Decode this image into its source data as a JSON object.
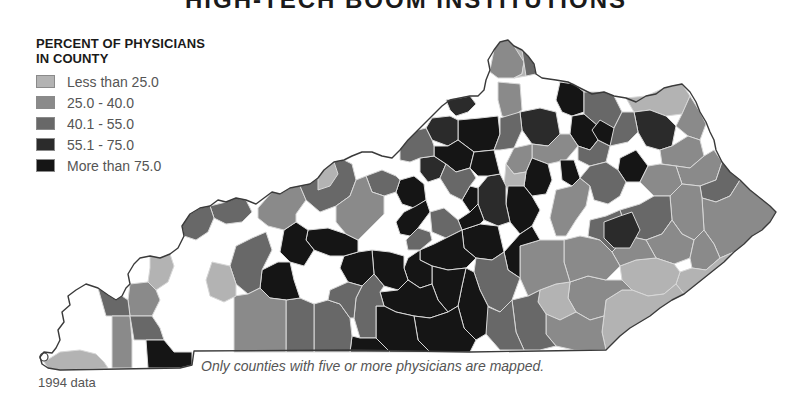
{
  "title": "HIGH-TECH BOOM INSTITUTIONS",
  "legend": {
    "title_line1": "PERCENT OF PHYSICIANS",
    "title_line2": "IN COUNTY",
    "items": [
      {
        "label": "Less than 25.0",
        "color": "#b3b3b3"
      },
      {
        "label": "25.0 - 40.0",
        "color": "#8a8a8a"
      },
      {
        "label": "40.1 - 55.0",
        "color": "#686868"
      },
      {
        "label": "55.1 - 75.0",
        "color": "#2b2b2b"
      },
      {
        "label": "More than 75.0",
        "color": "#151515"
      }
    ]
  },
  "note": "Only counties with five or more physicians are mapped.",
  "source": "1994 data",
  "colors": {
    "unmapped": "#ffffff",
    "border": "#d8d8d8",
    "outline": "#3a3a3a"
  },
  "map": {
    "state": "Kentucky",
    "outline": "M40,357 L44,352 L52,353 L56,348 L60,340 L58,330 L64,322 L62,312 L70,305 L68,296 L76,290 L86,284 L98,288 L108,295 L116,300 L122,296 L126,288 L130,284 L128,274 L134,264 L140,258 L150,256 L160,258 L170,254 L178,248 L184,236 L182,226 L190,214 L200,208 L210,206 L218,200 L226,202 L236,198 L246,200 L256,204 L264,198 L272,192 L280,194 L290,188 L300,186 L310,184 L318,178 L324,170 L334,162 L344,160 L352,156 L362,152 L372,152 L382,156 L392,158 L400,150 L408,140 L418,130 L426,122 L434,114 L442,106 L450,100 L460,98 L470,96 L478,96 L484,90 L486,80 L490,70 L488,60 L494,50 L500,42 L508,40 L514,46 L522,50 L528,56 L534,64 L536,74 L542,78 L556,80 L568,82 L580,88 L592,94 L604,92 L614,96 L626,98 L636,102 L646,96 L656,94 L664,88 L672,86 L682,84 L690,92 L696,102 L700,112 L706,122 L710,132 L714,140 L716,150 L722,162 L730,172 L740,180 L750,190 L760,198 L770,206 L776,212 L770,222 L762,230 L752,236 L744,244 L734,252 L724,262 L714,270 L704,278 L694,286 L684,294 L672,300 L660,308 L650,316 L640,322 L630,328 L620,336 L612,344 L606,350 L470,352 L350,350 L194,351 L192,365 L180,368 L60,370 L48,368 L42,364 Z",
    "counties": [
      {
        "id": "c1",
        "cls": 1,
        "d": "M490,70 L494,50 L500,42 L508,40 L514,46 L520,50 L524,62 L522,74 L514,78 L498,78 L490,72 Z"
      },
      {
        "id": "c2",
        "cls": 0,
        "d": "M514,46 L522,50 L528,56 L526,76 L514,78 L522,74 L524,62 Z"
      },
      {
        "id": "c3",
        "cls": 2,
        "d": "M522,50 L528,56 L534,64 L536,74 L526,76 Z"
      },
      {
        "id": "c4",
        "cls": 1,
        "d": "M498,82 L520,84 L522,110 L510,118 L502,116 L498,100 Z"
      },
      {
        "id": "c5",
        "cls": 3,
        "d": "M446,100 L460,98 L470,96 L476,104 L468,112 L456,116 L450,110 Z"
      },
      {
        "id": "c6",
        "cls": 4,
        "d": "M560,82 L574,84 L584,92 L584,112 L572,116 L562,112 L556,100 Z"
      },
      {
        "id": "c7",
        "cls": 2,
        "d": "M584,92 L604,92 L614,96 L622,112 L614,128 L598,126 L584,114 Z"
      },
      {
        "id": "c8",
        "cls": 0,
        "d": "M626,98 L646,96 L664,88 L682,84 L690,96 L682,114 L666,116 L650,110 L634,112 Z"
      },
      {
        "id": "c9",
        "cls": 3,
        "d": "M634,112 L650,110 L666,116 L676,126 L672,146 L660,150 L646,146 L638,132 Z"
      },
      {
        "id": "c10",
        "cls": 1,
        "d": "M682,114 L690,96 L700,112 L706,124 L700,140 L688,136 L676,126 Z"
      },
      {
        "id": "c11",
        "cls": 4,
        "d": "M572,116 L584,114 L598,126 L598,140 L590,150 L578,146 L570,134 Z"
      },
      {
        "id": "c12",
        "cls": 2,
        "d": "M598,126 L614,128 L622,112 L634,112 L638,132 L628,142 L610,146 L598,140 Z"
      },
      {
        "id": "c13",
        "cls": 3,
        "d": "M520,112 L540,108 L556,112 L560,134 L548,146 L532,144 L522,130 Z"
      },
      {
        "id": "c14",
        "cls": 4,
        "d": "M458,120 L480,118 L498,116 L500,134 L494,150 L474,152 L458,140 Z"
      },
      {
        "id": "c15",
        "cls": 3,
        "d": "M432,118 L450,116 L458,120 L458,140 L448,146 L432,140 L426,128 Z"
      },
      {
        "id": "c16",
        "cls": 2,
        "d": "M500,118 L520,112 L522,130 L514,148 L500,150 L494,150 L500,134 Z"
      },
      {
        "id": "c17",
        "cls": 1,
        "d": "M532,144 L548,146 L560,134 L570,134 L578,146 L566,160 L548,164 L532,158 Z"
      },
      {
        "id": "c18",
        "cls": 1,
        "d": "M514,148 L532,144 L532,158 L526,172 L514,174 L506,164 Z"
      },
      {
        "id": "c19",
        "cls": 2,
        "d": "M578,146 L590,150 L598,140 L610,146 L606,162 L590,166 L578,160 Z"
      },
      {
        "id": "c20",
        "cls": 4,
        "d": "M526,172 L532,158 L548,164 L552,180 L546,194 L532,196 L524,186 Z"
      },
      {
        "id": "c21",
        "cls": 4,
        "d": "M560,160 L574,160 L580,178 L572,186 L562,180 Z"
      },
      {
        "id": "c22",
        "cls": 0,
        "d": "M506,164 L514,174 L526,172 L524,186 L514,194 L504,186 Z"
      },
      {
        "id": "c23",
        "cls": 4,
        "d": "M620,158 L636,150 L648,166 L640,182 L626,182 L618,170 Z"
      },
      {
        "id": "c24",
        "cls": 1,
        "d": "M660,150 L672,146 L688,136 L700,140 L704,156 L690,168 L676,166 L662,164 Z"
      },
      {
        "id": "c25",
        "cls": 1,
        "d": "M676,166 L690,168 L704,156 L714,150 L722,162 L716,180 L700,186 L682,184 Z"
      },
      {
        "id": "c26",
        "cls": 2,
        "d": "M700,186 L716,180 L722,162 L730,172 L740,180 L730,196 L716,202 L702,198 Z"
      },
      {
        "id": "c27",
        "cls": 1,
        "d": "M640,182 L648,166 L660,164 L676,166 L682,184 L670,196 L654,196 Z"
      },
      {
        "id": "c28",
        "cls": 1,
        "d": "M702,198 L716,202 L730,196 L740,180 L750,190 L760,198 L770,206 L776,212 L770,222 L762,230 L752,236 L744,244 L734,252 L720,258 L714,244 L704,230 Z"
      },
      {
        "id": "c29",
        "cls": 1,
        "d": "M670,196 L682,184 L700,186 L702,198 L704,230 L694,240 L682,234 L672,220 Z"
      },
      {
        "id": "c30",
        "cls": 2,
        "d": "M620,210 L640,204 L654,196 L670,196 L672,220 L662,234 L646,240 L628,236 Z"
      },
      {
        "id": "c31",
        "cls": 1,
        "d": "M646,240 L662,234 L672,220 L682,234 L694,240 L690,258 L674,264 L656,258 Z"
      },
      {
        "id": "c32",
        "cls": 1,
        "d": "M694,240 L704,230 L714,244 L720,258 L706,270 L692,268 L690,258 Z"
      },
      {
        "id": "c33",
        "cls": 0,
        "d": "M692,268 L706,270 L720,258 L734,252 L724,262 L714,270 L704,278 L694,286 L684,294 L676,284 L680,272 Z"
      },
      {
        "id": "c34",
        "cls": 0,
        "d": "M620,266 L636,260 L656,258 L674,264 L680,272 L676,284 L664,294 L648,296 L632,290 L622,280 Z"
      },
      {
        "id": "c35",
        "cls": 1,
        "d": "M628,236 L646,240 L656,258 L636,260 L620,266 L612,252 Z"
      },
      {
        "id": "c36",
        "cls": 0,
        "d": "M606,300 L622,290 L632,290 L648,296 L664,294 L676,284 L684,294 L672,300 L660,308 L650,316 L640,322 L630,328 L620,336 L612,344 L606,350 L602,332 L604,316 Z"
      },
      {
        "id": "c37",
        "cls": 1,
        "d": "M570,282 L588,276 L606,280 L622,280 L632,290 L622,290 L606,300 L604,316 L590,320 L576,312 L568,298 Z"
      },
      {
        "id": "c38",
        "cls": 1,
        "d": "M564,240 L580,236 L600,240 L612,252 L620,266 L606,280 L588,276 L570,282 L564,262 Z"
      },
      {
        "id": "c39",
        "cls": 0,
        "d": "M540,290 L556,284 L570,282 L568,298 L576,312 L560,320 L546,314 L538,302 Z"
      },
      {
        "id": "c40",
        "cls": 1,
        "d": "M546,314 L560,320 L576,312 L590,320 L604,316 L602,332 L606,350 L574,350 L556,346 L546,334 Z"
      },
      {
        "id": "c41",
        "cls": 2,
        "d": "M512,300 L528,296 L540,290 L538,302 L546,314 L546,334 L556,346 L540,350 L524,350 L516,332 Z"
      },
      {
        "id": "c42",
        "cls": 1,
        "d": "M520,246 L540,240 L564,240 L564,262 L570,282 L556,284 L540,290 L528,296 L520,278 Z"
      },
      {
        "id": "c43",
        "cls": 1,
        "d": "M556,190 L572,186 L580,178 L590,186 L586,206 L576,220 L566,236 L556,236 L550,218 Z"
      },
      {
        "id": "c44",
        "cls": 2,
        "d": "M580,178 L590,166 L606,162 L618,170 L626,182 L620,196 L608,204 L594,200 L590,186 Z"
      },
      {
        "id": "c45",
        "cls": 2,
        "d": "M590,220 L606,216 L620,210 L628,236 L612,252 L600,240 L588,236 Z"
      },
      {
        "id": "c46",
        "cls": 3,
        "d": "M604,222 L620,216 L632,212 L640,230 L630,248 L614,248 L604,238 Z"
      },
      {
        "id": "c47",
        "cls": 4,
        "d": "M600,120 L614,128 L610,146 L598,140 L592,130 Z"
      },
      {
        "id": "c48",
        "cls": 4,
        "d": "M508,186 L524,186 L532,196 L540,210 L532,226 L520,234 L510,222 L506,204 Z"
      },
      {
        "id": "c49",
        "cls": 4,
        "d": "M520,234 L532,226 L540,240 L520,246 L520,278 L508,270 L504,252 Z"
      },
      {
        "id": "c50",
        "cls": 3,
        "d": "M488,176 L500,174 L506,186 L506,204 L510,222 L498,226 L484,220 L478,204 L478,188 Z"
      },
      {
        "id": "c51",
        "cls": 4,
        "d": "M462,230 L480,224 L498,226 L504,252 L492,260 L476,258 L464,248 Z"
      },
      {
        "id": "c52",
        "cls": 2,
        "d": "M476,258 L492,260 L504,252 L508,270 L520,278 L512,300 L500,312 L488,306 L480,290 L474,272 Z"
      },
      {
        "id": "c53",
        "cls": 2,
        "d": "M486,306 L500,312 L512,300 L516,332 L524,350 L500,350 L486,334 Z"
      },
      {
        "id": "c54",
        "cls": 4,
        "d": "M466,268 L474,272 L480,290 L488,306 L486,334 L476,340 L464,328 L458,306 L462,286 Z"
      },
      {
        "id": "c55",
        "cls": 4,
        "d": "M470,212 L478,204 L484,220 L480,224 L462,230 L458,220 Z"
      },
      {
        "id": "c56",
        "cls": 4,
        "d": "M470,186 L478,188 L478,204 L470,212 L462,200 Z"
      },
      {
        "id": "c57",
        "cls": 2,
        "d": "M430,212 L444,208 L458,220 L462,230 L446,238 L432,232 Z"
      },
      {
        "id": "c58",
        "cls": 4,
        "d": "M420,250 L434,244 L446,238 L462,230 L464,248 L476,258 L466,268 L448,270 L432,266 L420,260 Z"
      },
      {
        "id": "c59",
        "cls": 4,
        "d": "M432,266 L448,270 L466,268 L462,286 L458,306 L448,312 L438,300 L432,284 Z"
      },
      {
        "id": "c60",
        "cls": 4,
        "d": "M408,258 L420,250 L420,260 L432,266 L432,284 L420,288 L408,280 L404,268 Z"
      },
      {
        "id": "c61",
        "cls": 4,
        "d": "M400,180 L414,176 L424,184 L426,200 L414,208 L402,204 L396,192 Z"
      },
      {
        "id": "c62",
        "cls": 4,
        "d": "M404,212 L416,206 L426,200 L430,212 L418,228 L410,236 L400,234 L396,222 Z"
      },
      {
        "id": "c63",
        "cls": 3,
        "d": "M420,158 L434,156 L446,164 L440,178 L428,182 L420,172 Z"
      },
      {
        "id": "c64",
        "cls": 4,
        "d": "M434,146 L448,146 L458,140 L474,152 L470,168 L456,172 L446,164 L434,156 Z"
      },
      {
        "id": "c65",
        "cls": 2,
        "d": "M446,164 L456,172 L470,168 L476,178 L470,186 L462,200 L450,194 L440,178 Z"
      },
      {
        "id": "c66",
        "cls": 4,
        "d": "M474,152 L494,150 L500,174 L488,176 L478,176 L470,168 Z"
      },
      {
        "id": "c67",
        "cls": 2,
        "d": "M400,150 L408,140 L418,130 L426,128 L432,140 L434,146 L434,156 L420,158 L410,162 L400,160 Z"
      },
      {
        "id": "c68",
        "cls": 2,
        "d": "M366,176 L382,170 L396,176 L400,180 L396,192 L384,196 L372,192 Z"
      },
      {
        "id": "c69",
        "cls": 2,
        "d": "M406,240 L410,236 L418,228 L430,232 L432,240 L420,250 L408,250 Z"
      },
      {
        "id": "c70",
        "cls": 4,
        "d": "M372,250 L390,252 L404,256 L404,268 L408,280 L398,290 L384,286 L374,274 Z"
      },
      {
        "id": "c71",
        "cls": 4,
        "d": "M380,292 L398,290 L408,280 L420,288 L432,284 L438,300 L448,312 L430,318 L414,316 L396,312 L384,306 Z"
      },
      {
        "id": "c72",
        "cls": 4,
        "d": "M414,316 L430,318 L448,312 L458,306 L464,328 L476,340 L470,352 L430,352 L418,340 Z"
      },
      {
        "id": "c73",
        "cls": 4,
        "d": "M376,306 L384,306 L396,312 L414,316 L418,340 L430,352 L390,352 L376,338 Z"
      },
      {
        "id": "c74",
        "cls": 2,
        "d": "M362,286 L374,274 L384,286 L380,292 L384,306 L376,306 L376,338 L360,338 L354,318 L356,298 Z"
      },
      {
        "id": "c75",
        "cls": 4,
        "d": "M344,256 L358,252 L372,250 L374,274 L362,286 L348,282 L340,268 Z"
      },
      {
        "id": "c76",
        "cls": 4,
        "d": "M308,230 L328,228 L346,234 L358,240 L358,252 L344,256 L330,256 L314,250 L306,240 Z"
      },
      {
        "id": "c77",
        "cls": 4,
        "d": "M352,336 L360,338 L376,338 L390,352 L350,352 Z"
      },
      {
        "id": "c78",
        "cls": 2,
        "d": "M314,304 L328,300 L340,304 L350,318 L352,336 L350,352 L314,352 L314,330 Z"
      },
      {
        "id": "c79",
        "cls": 2,
        "d": "M286,300 L300,298 L314,304 L314,330 L314,352 L286,352 Z"
      },
      {
        "id": "c80",
        "cls": 2,
        "d": "M330,290 L348,282 L362,286 L356,298 L354,318 L350,318 L340,304 L328,300 Z"
      },
      {
        "id": "c81",
        "cls": 4,
        "d": "M262,270 L278,262 L290,262 L294,280 L300,298 L286,300 L270,298 L260,288 Z"
      },
      {
        "id": "c82",
        "cls": 4,
        "d": "M284,230 L296,222 L308,230 L306,240 L314,250 L304,266 L290,262 L280,252 Z"
      },
      {
        "id": "c83",
        "cls": 2,
        "d": "M236,246 L252,238 L266,232 L272,250 L262,270 L260,288 L248,294 L236,284 L230,266 Z"
      },
      {
        "id": "c84",
        "cls": 1,
        "d": "M234,296 L248,294 L260,288 L270,298 L286,300 L286,352 L234,352 Z"
      },
      {
        "id": "c85",
        "cls": 0,
        "d": "M212,262 L230,266 L236,284 L236,296 L224,302 L210,296 L206,280 Z"
      },
      {
        "id": "c86",
        "cls": 1,
        "d": "M258,208 L272,192 L280,194 L290,188 L300,186 L306,200 L296,214 L296,222 L284,230 L268,226 L258,218 Z"
      },
      {
        "id": "c87",
        "cls": 2,
        "d": "M300,186 L310,184 L318,178 L324,170 L334,162 L344,160 L352,164 L356,180 L350,196 L336,206 L320,212 L306,200 Z"
      },
      {
        "id": "c88",
        "cls": 1,
        "d": "M336,206 L350,196 L356,180 L366,176 L372,192 L384,196 L384,214 L370,228 L358,240 L346,234 L336,222 Z"
      },
      {
        "id": "c89",
        "cls": 0,
        "d": "M318,178 L324,170 L334,162 L338,174 L330,186 L318,190 Z"
      },
      {
        "id": "c90",
        "cls": 2,
        "d": "M210,206 L226,202 L236,198 L246,200 L252,212 L242,222 L226,224 L214,218 Z"
      },
      {
        "id": "c91",
        "cls": 2,
        "d": "M184,236 L182,226 L190,214 L200,208 L210,206 L214,218 L208,232 L196,240 Z"
      },
      {
        "id": "c92",
        "cls": 0,
        "d": "M150,256 L160,258 L170,254 L174,266 L168,282 L156,290 L148,282 L150,268 Z"
      },
      {
        "id": "c93",
        "cls": 1,
        "d": "M130,284 L148,282 L156,290 L160,300 L152,316 L130,316 L128,300 Z"
      },
      {
        "id": "c94",
        "cls": 2,
        "d": "M98,288 L108,295 L116,300 L122,296 L128,300 L130,316 L106,316 L102,302 Z"
      },
      {
        "id": "c95",
        "cls": 1,
        "d": "M112,316 L130,316 L132,340 L132,368 L112,368 Z"
      },
      {
        "id": "c96",
        "cls": 2,
        "d": "M130,316 L152,316 L160,328 L164,340 L146,340 L134,340 Z"
      },
      {
        "id": "c97",
        "cls": 4,
        "d": "M146,340 L164,340 L174,352 L192,352 L192,365 L180,368 L148,368 Z"
      },
      {
        "id": "c98",
        "cls": 0,
        "d": "M60,352 L80,350 L96,354 L104,362 L108,368 L60,370 L48,368 L44,362 Z"
      }
    ]
  }
}
